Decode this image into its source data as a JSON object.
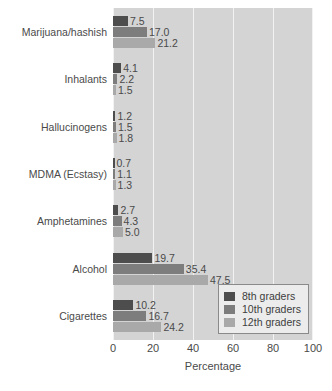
{
  "chart_data": {
    "type": "bar",
    "orientation": "horizontal",
    "title": "",
    "xlabel": "Percentage",
    "ylabel": "",
    "xlim": [
      0,
      100
    ],
    "xticks": [
      0,
      20,
      40,
      60,
      80,
      100
    ],
    "grid": true,
    "legend_position": "bottom-right-inside",
    "categories": [
      "Marijuana/hashish",
      "Inhalants",
      "Hallucinogens",
      "MDMA (Ecstasy)",
      "Amphetamines",
      "Alcohol",
      "Cigarettes"
    ],
    "series": [
      {
        "name": "8th graders",
        "color": "#4d4d4d",
        "values": [
          7.5,
          4.1,
          1.2,
          0.7,
          2.7,
          19.7,
          10.2
        ],
        "labels": [
          "7.5",
          "4.1",
          "1.2",
          "0.7",
          "2.7",
          "19.7",
          "10.2"
        ]
      },
      {
        "name": "10th graders",
        "color": "#7d7d7d",
        "values": [
          17.0,
          2.2,
          1.5,
          1.1,
          4.3,
          35.4,
          16.7
        ],
        "labels": [
          "17.0",
          "2.2",
          "1.5",
          "1.1",
          "4.3",
          "35.4",
          "16.7"
        ]
      },
      {
        "name": "12th graders",
        "color": "#a9a9a9",
        "values": [
          21.2,
          1.5,
          1.8,
          1.3,
          5.0,
          47.5,
          24.2
        ],
        "labels": [
          "21.2",
          "1.5",
          "1.8",
          "1.3",
          "5.0",
          "47.5",
          "24.2"
        ]
      }
    ]
  },
  "axis": {
    "tick_labels": [
      "0",
      "20",
      "40",
      "60",
      "80",
      "100"
    ],
    "title": "Percentage"
  },
  "legend": {
    "entries": [
      {
        "label": "8th graders",
        "color": "#4d4d4d"
      },
      {
        "label": "10th graders",
        "color": "#7d7d7d"
      },
      {
        "label": "12th graders",
        "color": "#a9a9a9"
      }
    ]
  },
  "style": {
    "plot_background": "#d4d4d4",
    "gridline_color": "#f2f2f2",
    "page_background": "#ffffff",
    "text_color": "#4a4a4a"
  }
}
